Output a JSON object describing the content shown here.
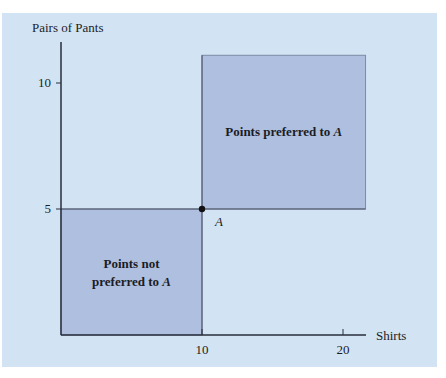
{
  "chart_data": {
    "type": "scatter",
    "title": "",
    "xlabel": "Shirts",
    "ylabel": "Pairs of Pants",
    "xlim": [
      0,
      21.7
    ],
    "ylim": [
      0,
      11.1
    ],
    "x_ticks": [
      10,
      20
    ],
    "x_tick_labels": [
      "10",
      "20"
    ],
    "y_ticks": [
      5,
      10
    ],
    "y_tick_labels": [
      "5",
      "10"
    ],
    "grid": false,
    "points": [
      {
        "label": "A",
        "x": 10,
        "y": 5
      }
    ],
    "regions": [
      {
        "name": "preferred",
        "label": "Points preferred to",
        "label_point": "A",
        "x": [
          10,
          21.6
        ],
        "y": [
          5,
          11.1
        ]
      },
      {
        "name": "not-preferred",
        "label_line1": "Points not",
        "label_line2": "preferred to",
        "label_point": "A",
        "x": [
          0,
          10
        ],
        "y": [
          0,
          5
        ]
      }
    ]
  },
  "colors": {
    "background": "#d2e4f4",
    "region_fill": "#aebfe0",
    "axis": "#2a2e3a",
    "point": "#111111"
  }
}
